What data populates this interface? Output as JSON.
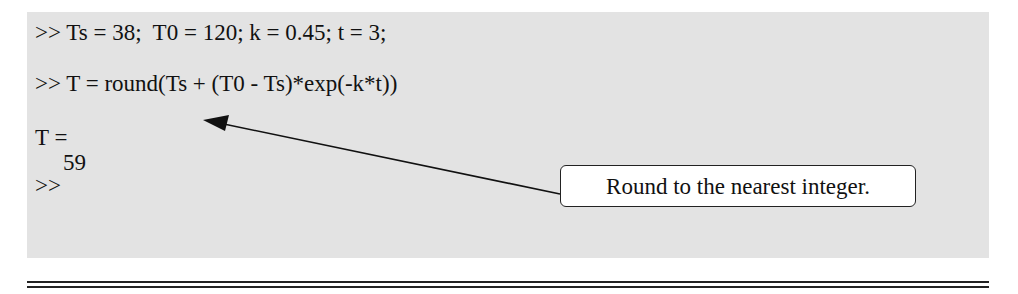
{
  "console": {
    "lines": [
      ">> Ts = 38;  T0 = 120; k = 0.45; t = 3;",
      ">> T = round(Ts + (T0 - Ts)*exp(-k*t))",
      "T =",
      "59",
      ">>"
    ]
  },
  "annotation": {
    "text": "Round to the nearest integer.",
    "points_to": "round"
  },
  "colors": {
    "panel_background": "#e3e3e3",
    "callout_background": "#ffffff",
    "text": "#111111"
  }
}
